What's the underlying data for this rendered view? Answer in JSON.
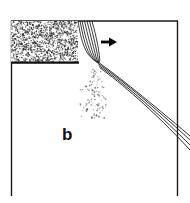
{
  "figure": {
    "panel_label": "b",
    "background_color": "#ffffff",
    "ink_color": "#1a1a1a",
    "stipple_color": "#2b2b2b",
    "frame": {
      "left_x": 11,
      "right_x": 178,
      "top_y": 21,
      "bottom_y": 196,
      "stroke_width": 1.4,
      "has_bottom_edge": false
    },
    "stipple_block": {
      "name": "granular-solid-block",
      "x": 11,
      "y": 21,
      "width": 67,
      "height": 42,
      "dot_count": 1500,
      "base_line_color": "#111111"
    },
    "curved_fan": {
      "name": "necking-curves",
      "line_count": 7,
      "origin_x": 78,
      "origin_y": 21,
      "neck_x": 98,
      "neck_y": 62
    },
    "arrow": {
      "name": "flow-direction-arrow",
      "direction": "right",
      "x": 101,
      "y": 42,
      "length": 15,
      "color": "#000000"
    },
    "diagonal_band": {
      "name": "discharge-stream-band",
      "line_count": 4,
      "start_x": 97,
      "start_y": 62,
      "end_x": 190,
      "end_y": 150
    },
    "dot_spray": {
      "name": "particle-spray",
      "dot_count": 150,
      "origin_x": 97,
      "origin_y": 64,
      "spread_x": [
        80,
        124
      ],
      "spread_y": [
        64,
        118
      ]
    }
  }
}
